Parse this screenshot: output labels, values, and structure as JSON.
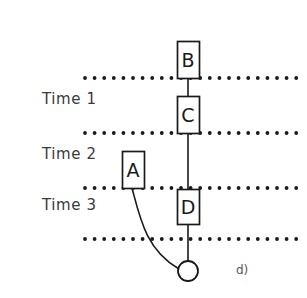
{
  "figure": {
    "panel_label": "d)",
    "width": 307,
    "height": 298,
    "background_color": "#ffffff",
    "line_color": "#1a1a1a",
    "text_color": "#3a3a3a"
  },
  "time_labels": [
    {
      "text": "Time 1",
      "x": 42,
      "y": 92
    },
    {
      "text": "Time 2",
      "x": 42,
      "y": 147
    },
    {
      "text": "Time 3",
      "x": 42,
      "y": 198
    }
  ],
  "dotted_lines": [
    {
      "name": "dotted-line-1",
      "y": 78,
      "x_start": 85,
      "x_end": 297
    },
    {
      "name": "dotted-line-2",
      "y": 133,
      "x_start": 85,
      "x_end": 297
    },
    {
      "name": "dotted-line-3",
      "y": 188,
      "x_start": 85,
      "x_end": 297
    },
    {
      "name": "dotted-line-4",
      "y": 239,
      "x_start": 85,
      "x_end": 297
    }
  ],
  "dot_style": {
    "radius": 1.9,
    "spacing": 9.6
  },
  "nodes": [
    {
      "id": "B",
      "label": "B",
      "x": 177,
      "y": 41,
      "width": 22,
      "height": 37
    },
    {
      "id": "C",
      "label": "C",
      "x": 177,
      "y": 96,
      "width": 22,
      "height": 37
    },
    {
      "id": "A",
      "label": "A",
      "x": 122,
      "y": 151,
      "width": 22,
      "height": 37
    },
    {
      "id": "D",
      "label": "D",
      "x": 177,
      "y": 189,
      "width": 22,
      "height": 35
    }
  ],
  "connectors": [
    {
      "name": "connector-b-to-c",
      "from": "B",
      "to": "C",
      "x1": 188,
      "y1": 78,
      "x2": 188,
      "y2": 96
    },
    {
      "name": "connector-c-to-d",
      "from": "C",
      "to": "D",
      "x1": 188,
      "y1": 133,
      "x2": 188,
      "y2": 189
    },
    {
      "name": "connector-d-to-circle",
      "from": "D",
      "to": "circle",
      "x1": 188,
      "y1": 224,
      "x2": 188,
      "y2": 261
    }
  ],
  "curve": {
    "name": "curve-a-to-circle",
    "from": "A",
    "to": "circle",
    "start_x": 132,
    "start_y": 188,
    "control_x": 140,
    "control_y": 250,
    "end_x": 179,
    "end_y": 269
  },
  "circle": {
    "name": "terminal-circle",
    "cx": 188,
    "cy": 271,
    "r": 10
  }
}
